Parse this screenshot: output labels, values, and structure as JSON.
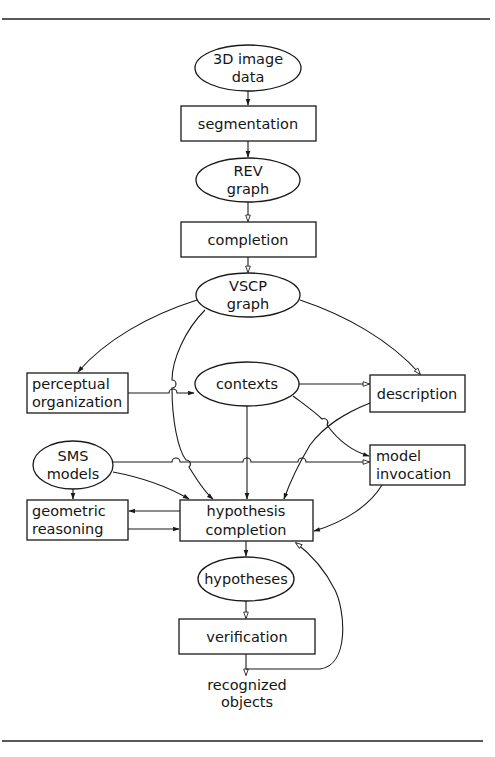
{
  "diagram": {
    "type": "flowchart",
    "nodes": {
      "image_data": {
        "shape": "ellipse",
        "line1": "3D image",
        "line2": "data"
      },
      "segmentation": {
        "shape": "rect",
        "label": "segmentation"
      },
      "rev_graph": {
        "shape": "ellipse",
        "line1": "REV",
        "line2": "graph"
      },
      "completion": {
        "shape": "rect",
        "label": "completion"
      },
      "vscp_graph": {
        "shape": "ellipse",
        "line1": "VSCP",
        "line2": "graph"
      },
      "perceptual_organization": {
        "shape": "rect",
        "line1": "perceptual",
        "line2": "organization"
      },
      "contexts": {
        "shape": "ellipse",
        "label": "contexts"
      },
      "description": {
        "shape": "rect",
        "label": "description"
      },
      "sms_models": {
        "shape": "ellipse",
        "line1": "SMS",
        "line2": "models"
      },
      "model_invocation": {
        "shape": "rect",
        "line1": "model",
        "line2": "invocation"
      },
      "geometric_reasoning": {
        "shape": "rect",
        "line1": "geometric",
        "line2": "reasoning"
      },
      "hypothesis_completion": {
        "shape": "rect",
        "line1": "hypothesis",
        "line2": "completion"
      },
      "hypotheses": {
        "shape": "ellipse",
        "label": "hypotheses"
      },
      "verification": {
        "shape": "rect",
        "label": "verification"
      },
      "recognized_objects": {
        "shape": "text",
        "line1": "recognized",
        "line2": "objects"
      }
    },
    "edges": [
      {
        "from": "3D image data",
        "to": "segmentation"
      },
      {
        "from": "segmentation",
        "to": "REV graph"
      },
      {
        "from": "REV graph",
        "to": "completion"
      },
      {
        "from": "completion",
        "to": "VSCP graph"
      },
      {
        "from": "VSCP graph",
        "to": "perceptual organization"
      },
      {
        "from": "VSCP graph",
        "to": "description"
      },
      {
        "from": "VSCP graph",
        "to": "hypothesis completion"
      },
      {
        "from": "perceptual organization",
        "to": "contexts"
      },
      {
        "from": "contexts",
        "to": "description"
      },
      {
        "from": "contexts",
        "to": "model invocation"
      },
      {
        "from": "contexts",
        "to": "hypothesis completion"
      },
      {
        "from": "description",
        "to": "hypothesis completion"
      },
      {
        "from": "SMS models",
        "to": "model invocation"
      },
      {
        "from": "SMS models",
        "to": "hypothesis completion"
      },
      {
        "from": "SMS models",
        "to": "geometric reasoning"
      },
      {
        "from": "hypothesis completion",
        "to": "geometric reasoning"
      },
      {
        "from": "geometric reasoning",
        "to": "hypothesis completion"
      },
      {
        "from": "model invocation",
        "to": "hypothesis completion"
      },
      {
        "from": "hypothesis completion",
        "to": "hypotheses"
      },
      {
        "from": "hypotheses",
        "to": "verification"
      },
      {
        "from": "verification",
        "to": "recognized objects"
      },
      {
        "from": "verification",
        "to": "hypothesis completion"
      }
    ]
  }
}
